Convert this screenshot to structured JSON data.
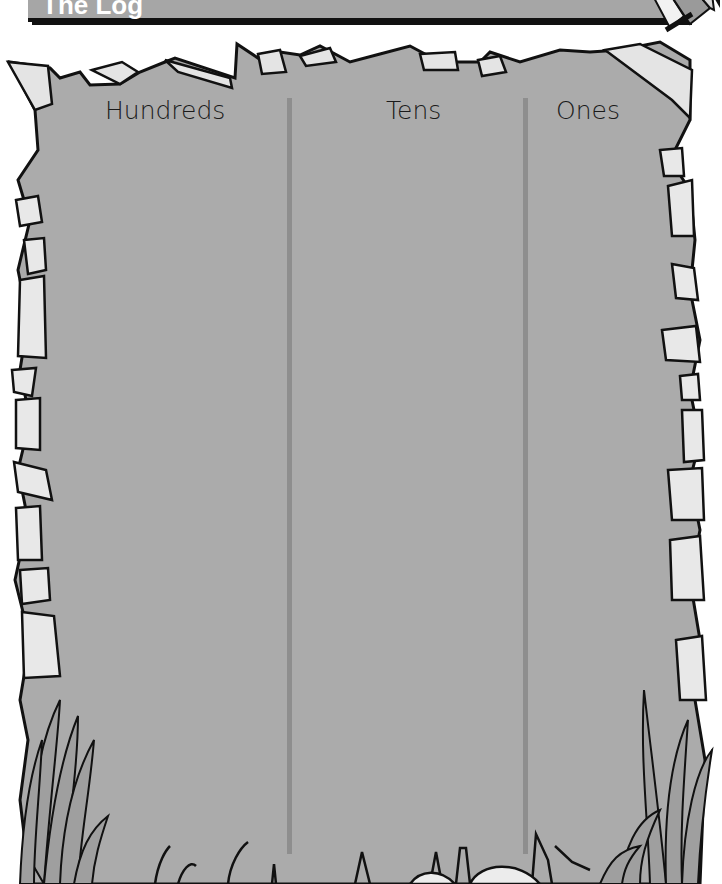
{
  "header": {
    "title": "The Log"
  },
  "chart": {
    "columns": [
      {
        "label": "Hundreds"
      },
      {
        "label": "Tens"
      },
      {
        "label": "Ones"
      }
    ]
  },
  "colors": {
    "panel_fill": "#ababab",
    "divider": "#8e8e8e",
    "outline": "#111111",
    "rock_light": "#e9e9e9",
    "title_bar": "#a6a6a6"
  }
}
